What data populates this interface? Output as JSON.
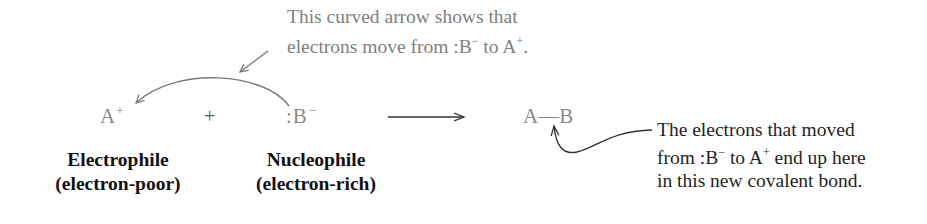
{
  "annotation_top": {
    "line1": "This curved arrow shows that",
    "line2_prefix": "electrons move from ",
    "line2_from": ":B",
    "line2_from_charge": "−",
    "line2_mid": " to A",
    "line2_to_charge": "+",
    "line2_suffix": "."
  },
  "reaction": {
    "reactant1": {
      "symbol": "A",
      "charge": "+"
    },
    "operator": "+",
    "reactant2": {
      "symbol": ":B",
      "charge": "−"
    },
    "product": {
      "left": "A",
      "bond": "—",
      "right": "B"
    }
  },
  "labels": {
    "reactant1_title": "Electrophile",
    "reactant1_subtitle": "(electron-poor)",
    "reactant2_title": "Nucleophile",
    "reactant2_subtitle": "(electron-rich)"
  },
  "annotation_right": {
    "line1": "The electrons that moved",
    "line2_prefix": "from ",
    "line2_from": ":B",
    "line2_from_charge": "−",
    "line2_mid": " to A",
    "line2_to_charge": "+",
    "line2_suffix": " end up here",
    "line3": "in this new covalent bond."
  },
  "colors": {
    "annotation_gray": "#808080",
    "species_gray": "#8a8a8a",
    "label_dark": "#111111",
    "arrow_gray": "#7a7a7a",
    "arrow_dark": "#333333"
  }
}
